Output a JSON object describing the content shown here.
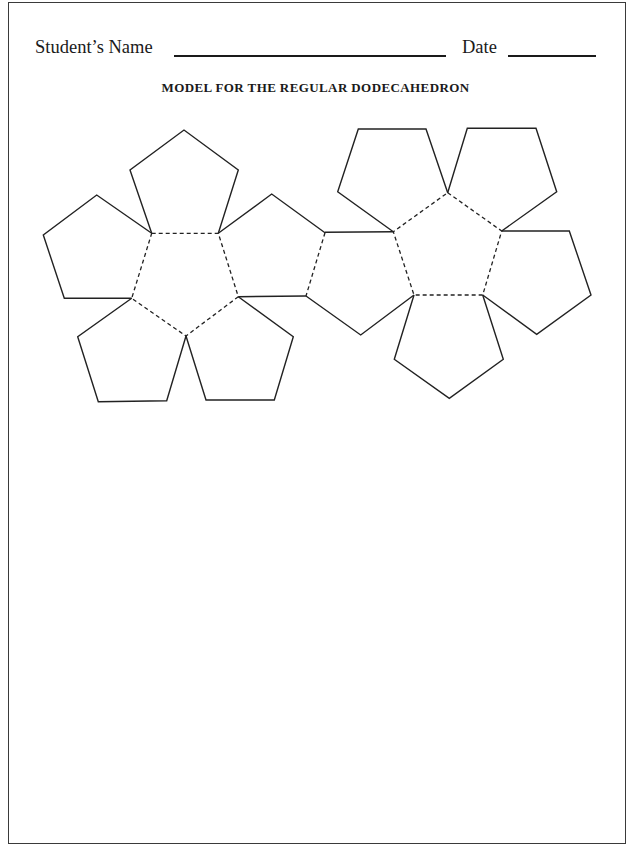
{
  "header": {
    "student_name_label": "Student’s Name",
    "student_name_value": "",
    "date_label": "Date",
    "date_value": ""
  },
  "title": "MODEL FOR THE REGULAR DODECAHEDRON",
  "net": {
    "description": "Regular dodecahedron net: two flowers of six pentagons each; solid lines are cut lines, dashed lines are fold lines",
    "pentagon_count": 12,
    "colors": {
      "line": "#222222",
      "background": "#ffffff",
      "border": "#3a3a3a"
    }
  }
}
